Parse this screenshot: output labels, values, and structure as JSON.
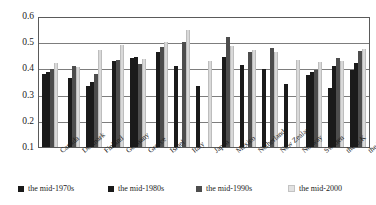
{
  "chart_data": {
    "type": "bar",
    "title": "",
    "subtitle": "",
    "xlabel": "",
    "ylabel": "",
    "ylim": [
      0.1,
      0.6
    ],
    "yticks": [
      0.6,
      0.5,
      0.4,
      0.3,
      0.2,
      0.1
    ],
    "ytick_labels": [
      "0.6",
      "0.5",
      "0.4",
      "0.3",
      "0.2",
      "0.1"
    ],
    "grid": true,
    "legend_position": "bottom",
    "categories": [
      "Canada",
      "Denmark",
      "Finland",
      "Germany",
      "Greece",
      "Israel",
      "Italy",
      "Japan",
      "Mexico",
      "Netherlands",
      "New Zealand",
      "Norway",
      "Sweden",
      "the U.K",
      "the U.S"
    ],
    "series": [
      {
        "name": "the mid-1970s",
        "color": "#1a1a1a",
        "values": [
          0.382,
          0.0,
          0.336,
          0.0,
          0.444,
          0.0,
          0.414,
          0.338,
          0.0,
          0.418,
          0.401,
          0.343,
          0.379,
          0.33,
          0.399
        ]
      },
      {
        "name": "the mid-1980s",
        "color": "#1a1a1a",
        "values": [
          0.389,
          0.367,
          0.352,
          0.432,
          0.446,
          0.467,
          0.0,
          0.0,
          0.446,
          0.0,
          0.0,
          0.0,
          0.389,
          0.412,
          0.424
        ]
      },
      {
        "name": "the mid-1990s",
        "color": "#4d4d4d",
        "values": [
          0.4,
          0.412,
          0.383,
          0.436,
          0.421,
          0.485,
          0.503,
          0.0,
          0.525,
          0.468,
          0.482,
          0.0,
          0.396,
          0.442,
          0.47
        ]
      },
      {
        "name": "the mid-2000",
        "color": "#d9d9d9",
        "values": [
          0.425,
          0.409,
          0.475,
          0.492,
          0.441,
          0.503,
          0.55,
          0.432,
          0.488,
          0.476,
          0.465,
          0.435,
          0.428,
          0.432,
          0.477
        ]
      }
    ]
  },
  "legend": {
    "items": [
      {
        "label": "the mid-1970s"
      },
      {
        "label": "the mid-1980s"
      },
      {
        "label": "the mid-1990s"
      },
      {
        "label": "the mid-2000"
      }
    ]
  }
}
